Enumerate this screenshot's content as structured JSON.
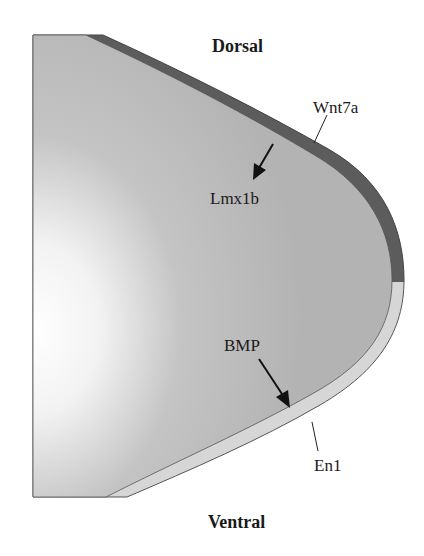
{
  "diagram": {
    "axis_labels": {
      "top": "Dorsal",
      "bottom": "Ventral"
    },
    "labels": {
      "dorsal_ectoderm_signal": "Wnt7a",
      "dorsal_mesenchyme_target": "Lmx1b",
      "ventral_signal": "BMP",
      "ventral_ectoderm_marker": "En1"
    },
    "regions": [
      {
        "name": "dorsal ectoderm",
        "color": "#5a5a5a"
      },
      {
        "name": "ventral ectoderm",
        "color": "#d4d4d4"
      },
      {
        "name": "mesenchyme",
        "color": "#b8b8b8"
      }
    ],
    "arrows": [
      {
        "from": "Wnt7a (dorsal ectoderm)",
        "to": "Lmx1b"
      },
      {
        "from": "BMP",
        "to": "ventral ectoderm"
      }
    ]
  }
}
